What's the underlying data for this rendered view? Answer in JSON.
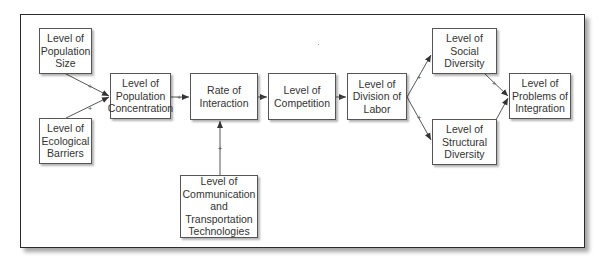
{
  "diagram": {
    "type": "causal-flow",
    "nodes": {
      "population_size": "Level of\nPopulation\nSize",
      "ecological_barriers": "Level of\nEcological\nBarriers",
      "population_concentration": "Level of\nPopulation\nConcentration",
      "rate_of_interaction": "Rate of\nInteraction",
      "competition": "Level of\nCompetition",
      "division_of_labor": "Level of\nDivision of\nLabor",
      "social_diversity": "Level of\nSocial\nDiversity",
      "structural_diversity": "Level of\nStructural\nDiversity",
      "problems_of_integration": "Level of\nProblems of\nIntegration",
      "communication_transportation": "Level of\nCommunication\nand\nTransportation\nTechnologies"
    },
    "edges": [
      {
        "from": "population_size",
        "to": "population_concentration",
        "sign": "+"
      },
      {
        "from": "ecological_barriers",
        "to": "population_concentration",
        "sign": "+"
      },
      {
        "from": "population_concentration",
        "to": "rate_of_interaction",
        "sign": "+"
      },
      {
        "from": "communication_transportation",
        "to": "rate_of_interaction",
        "sign": "+"
      },
      {
        "from": "rate_of_interaction",
        "to": "competition",
        "sign": "+"
      },
      {
        "from": "competition",
        "to": "division_of_labor",
        "sign": "+"
      },
      {
        "from": "division_of_labor",
        "to": "social_diversity",
        "sign": "+"
      },
      {
        "from": "division_of_labor",
        "to": "structural_diversity",
        "sign": "+"
      },
      {
        "from": "social_diversity",
        "to": "problems_of_integration",
        "sign": "+"
      },
      {
        "from": "structural_diversity",
        "to": "problems_of_integration",
        "sign": "+"
      }
    ],
    "sign_label": "+",
    "colors": {
      "line": "#444444",
      "border": "#555555",
      "text": "#333333"
    }
  }
}
